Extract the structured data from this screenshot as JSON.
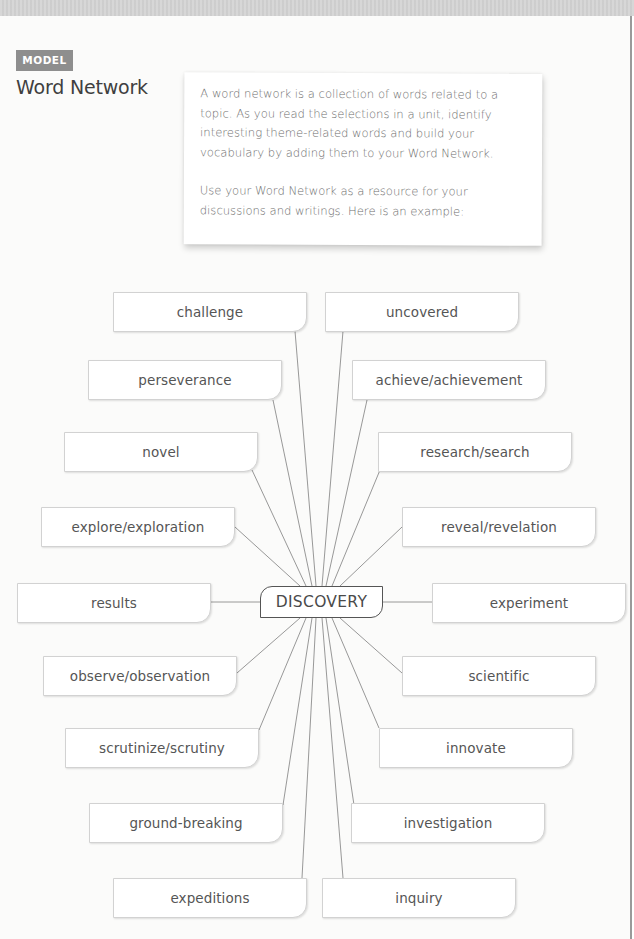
{
  "header": {
    "badge": "MODEL",
    "title": "Word Network"
  },
  "intro": {
    "paragraph1": "A word network is a collection of words related to a topic. As you read the selections in a unit, identify interesting theme-related words and build your vocabulary by adding them to your Word Network.",
    "paragraph2": "Use your Word Network as a resource for your discussions and writings. Here is an example:"
  },
  "network": {
    "center": "DISCOVERY",
    "colors": {
      "line": "#8c8c8c",
      "box_border": "#d2d2d2",
      "center_border": "#555555"
    },
    "left": [
      "challenge",
      "perseverance",
      "novel",
      "explore/exploration",
      "results",
      "observe/observation",
      "scrutinize/scrutiny",
      "ground-breaking",
      "expeditions"
    ],
    "right": [
      "uncovered",
      "achieve/achievement",
      "research/search",
      "reveal/revelation",
      "experiment",
      "scientific",
      "innovate",
      "investigation",
      "inquiry"
    ]
  }
}
